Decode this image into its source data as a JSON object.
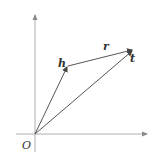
{
  "diagram": {
    "type": "vector-translation",
    "labels": {
      "origin": "O",
      "head": "h",
      "relation": "r",
      "tail": "t"
    },
    "points": {
      "origin": [
        35,
        134
      ],
      "h": [
        68,
        66
      ],
      "t": [
        133,
        50
      ]
    },
    "axes": {
      "x_axis_end": [
        148,
        134
      ],
      "y_axis_end": [
        35,
        14
      ]
    },
    "colors": {
      "line": "#555555",
      "axis": "#888888",
      "text": "#333333",
      "background": "#ffffff"
    }
  }
}
